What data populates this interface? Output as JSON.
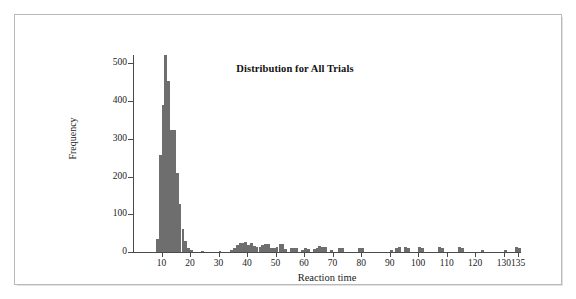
{
  "figure": {
    "border_color": "#b9b9b9",
    "background": "#ffffff"
  },
  "chart_data": {
    "type": "bar",
    "subtype": "histogram",
    "title": "Distribution for All Trials",
    "xlabel": "Reaction time",
    "ylabel": "Frequency",
    "bar_color": "#6e6e6e",
    "axis_color": "#4a4a4a",
    "grid": false,
    "legend": null,
    "bin_width": 1,
    "xlim": [
      0,
      138
    ],
    "ylim": [
      0,
      540
    ],
    "xticks": [
      10,
      20,
      30,
      40,
      50,
      60,
      70,
      80,
      90,
      100,
      110,
      120,
      130,
      135
    ],
    "xtick_labels": [
      "10",
      "20",
      "30",
      "40",
      "50",
      "60",
      "70",
      "80",
      "90",
      "100",
      "110",
      "120",
      "130",
      "135"
    ],
    "yticks": [
      0,
      100,
      200,
      300,
      400,
      500
    ],
    "ytick_labels": [
      "0",
      "100",
      "200",
      "300",
      "400",
      "500"
    ],
    "bins": [
      {
        "x": 8,
        "value": 35
      },
      {
        "x": 9,
        "value": 258
      },
      {
        "x": 10,
        "value": 390
      },
      {
        "x": 11,
        "value": 522
      },
      {
        "x": 12,
        "value": 452
      },
      {
        "x": 13,
        "value": 324
      },
      {
        "x": 14,
        "value": 324
      },
      {
        "x": 15,
        "value": 210
      },
      {
        "x": 16,
        "value": 127
      },
      {
        "x": 17,
        "value": 60
      },
      {
        "x": 18,
        "value": 30
      },
      {
        "x": 19,
        "value": 12
      },
      {
        "x": 20,
        "value": 6
      },
      {
        "x": 24,
        "value": 4
      },
      {
        "x": 30,
        "value": 4
      },
      {
        "x": 34,
        "value": 6
      },
      {
        "x": 35,
        "value": 10
      },
      {
        "x": 36,
        "value": 20
      },
      {
        "x": 37,
        "value": 24
      },
      {
        "x": 38,
        "value": 24
      },
      {
        "x": 39,
        "value": 26
      },
      {
        "x": 40,
        "value": 18
      },
      {
        "x": 41,
        "value": 24
      },
      {
        "x": 42,
        "value": 16
      },
      {
        "x": 43,
        "value": 14
      },
      {
        "x": 44,
        "value": 14
      },
      {
        "x": 45,
        "value": 20
      },
      {
        "x": 46,
        "value": 22
      },
      {
        "x": 47,
        "value": 22
      },
      {
        "x": 48,
        "value": 12
      },
      {
        "x": 49,
        "value": 10
      },
      {
        "x": 50,
        "value": 14
      },
      {
        "x": 51,
        "value": 22
      },
      {
        "x": 52,
        "value": 22
      },
      {
        "x": 53,
        "value": 8
      },
      {
        "x": 55,
        "value": 10
      },
      {
        "x": 56,
        "value": 12
      },
      {
        "x": 57,
        "value": 10
      },
      {
        "x": 59,
        "value": 6
      },
      {
        "x": 60,
        "value": 12
      },
      {
        "x": 61,
        "value": 8
      },
      {
        "x": 63,
        "value": 8
      },
      {
        "x": 64,
        "value": 12
      },
      {
        "x": 65,
        "value": 16
      },
      {
        "x": 66,
        "value": 14
      },
      {
        "x": 67,
        "value": 14
      },
      {
        "x": 69,
        "value": 6
      },
      {
        "x": 72,
        "value": 12
      },
      {
        "x": 73,
        "value": 10
      },
      {
        "x": 79,
        "value": 12
      },
      {
        "x": 80,
        "value": 10
      },
      {
        "x": 90,
        "value": 6
      },
      {
        "x": 92,
        "value": 12
      },
      {
        "x": 93,
        "value": 14
      },
      {
        "x": 95,
        "value": 14
      },
      {
        "x": 96,
        "value": 12
      },
      {
        "x": 100,
        "value": 14
      },
      {
        "x": 101,
        "value": 12
      },
      {
        "x": 107,
        "value": 14
      },
      {
        "x": 108,
        "value": 10
      },
      {
        "x": 114,
        "value": 14
      },
      {
        "x": 115,
        "value": 12
      },
      {
        "x": 122,
        "value": 5
      },
      {
        "x": 130,
        "value": 6
      },
      {
        "x": 134,
        "value": 14
      },
      {
        "x": 135,
        "value": 12
      }
    ]
  }
}
